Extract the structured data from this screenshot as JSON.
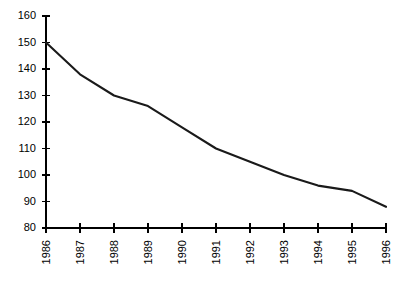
{
  "chart_data": {
    "type": "line",
    "title": "",
    "subtitle": "",
    "xlabel": "",
    "ylabel": "",
    "categories": [
      "1986",
      "1987",
      "1988",
      "1989",
      "1990",
      "1991",
      "1992",
      "1993",
      "1994",
      "1995",
      "1996"
    ],
    "x": [
      1986,
      1987,
      1988,
      1989,
      1990,
      1991,
      1992,
      1993,
      1994,
      1995,
      1996
    ],
    "values": [
      150,
      138,
      130,
      126,
      118,
      110,
      105,
      100,
      96,
      94,
      88
    ],
    "series": [
      {
        "name": "",
        "values": [
          150,
          138,
          130,
          126,
          118,
          110,
          105,
          100,
          96,
          94,
          88
        ]
      }
    ],
    "ylim": [
      80,
      160
    ],
    "yticks": [
      80,
      90,
      100,
      110,
      120,
      130,
      140,
      150,
      160
    ],
    "ytick_labels": [
      "80",
      "90",
      "100",
      "110",
      "120",
      "130",
      "140",
      "150",
      "160"
    ],
    "xticks": [
      1986,
      1987,
      1988,
      1989,
      1990,
      1991,
      1992,
      1993,
      1994,
      1995,
      1996
    ],
    "xtick_labels": [
      "1986",
      "1987",
      "1988",
      "1989",
      "1990",
      "1991",
      "1992",
      "1993",
      "1994",
      "1995",
      "1996"
    ],
    "xtick_rotation": -90,
    "grid": false,
    "legend": false,
    "legend_position": "none",
    "line_color": "#1a1a1a",
    "axis_color": "#000000",
    "background_color": "#ffffff",
    "annotations": []
  },
  "layout": {
    "plot_left": 46,
    "plot_right": 386,
    "plot_top": 16,
    "plot_bottom": 228
  }
}
